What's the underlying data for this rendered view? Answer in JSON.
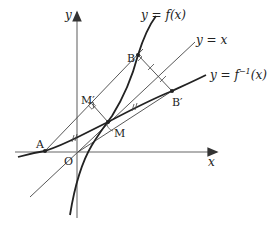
{
  "diagram": {
    "axes": {
      "x_label": "x",
      "y_label": "y",
      "origin_label": "O"
    },
    "curves": {
      "f": {
        "label": "y = f(x)"
      },
      "f_inverse": {
        "label_prefix": "y = f",
        "label_sup": "−1",
        "label_suffix": "(x)"
      },
      "identity": {
        "label": "y = x"
      }
    },
    "points": {
      "A": "A",
      "B": "B",
      "B_prime": "B′",
      "M": "M",
      "M_prime": "M′"
    },
    "colors": {
      "curve": "#222222",
      "axis": "#999999",
      "line": "#444444"
    }
  }
}
